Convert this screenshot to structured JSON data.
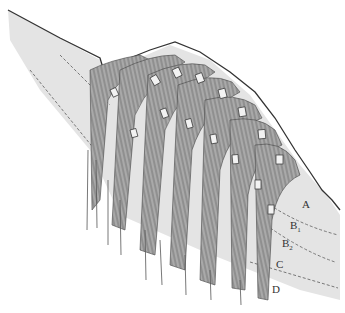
{
  "diagram": {
    "type": "geological cross-section",
    "colors": {
      "background": "#ffffff",
      "slope_fill": "#e4e4e4",
      "strata_stroke": "#555555",
      "outline": "#333333",
      "dashed_boundary": "#777777"
    },
    "labels": [
      {
        "id": "A",
        "text": "A",
        "sub": "",
        "x": 302,
        "y": 205
      },
      {
        "id": "B1",
        "text": "B",
        "sub": "1",
        "x": 290,
        "y": 225
      },
      {
        "id": "B2",
        "text": "B",
        "sub": "2",
        "x": 282,
        "y": 243
      },
      {
        "id": "C",
        "text": "C",
        "sub": "",
        "x": 276,
        "y": 264
      },
      {
        "id": "D",
        "text": "D",
        "sub": "",
        "x": 272,
        "y": 290
      }
    ]
  }
}
